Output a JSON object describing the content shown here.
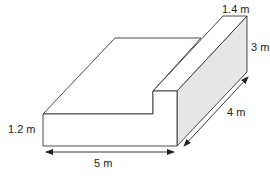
{
  "diagram": {
    "type": "3d-solid-l-shape",
    "shape": "L-shaped prism (step block)",
    "colors": {
      "line": "#333333",
      "shaded_face": "#e6e6e6",
      "background": "#ffffff",
      "text": "#222222"
    },
    "labels": {
      "wall_width": "1.4 m",
      "wall_height": "3 m",
      "step_height": "1.2 m",
      "length": "5 m",
      "depth": "4 m"
    },
    "dimensions": {
      "length_m": 5,
      "depth_m": 4,
      "wall_height_m": 3,
      "wall_width_m": 1.4,
      "step_height_m": 1.2
    }
  }
}
